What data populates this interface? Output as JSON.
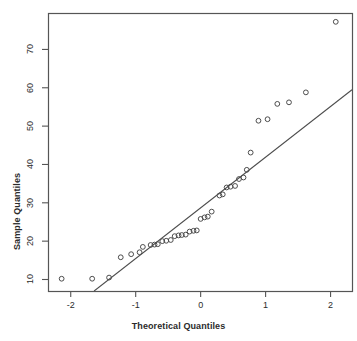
{
  "chart_data": {
    "type": "scatter",
    "title": "",
    "xlabel": "Theoretical Quantiles",
    "ylabel": "Sample Quantiles",
    "xlim": [
      -2.35,
      2.33
    ],
    "ylim": [
      7.0,
      79.5
    ],
    "xticks": [
      -2,
      -1,
      0,
      1,
      2
    ],
    "xtick_labels": [
      "-2",
      "-1",
      "0",
      "1",
      "2"
    ],
    "yticks": [
      10,
      20,
      30,
      40,
      50,
      60,
      70
    ],
    "ytick_labels": [
      "10",
      "20",
      "30",
      "40",
      "50",
      "60",
      "70"
    ],
    "grid": false,
    "legend": null,
    "frame": true,
    "marker": "open-circle",
    "marker_color": "#4d4d4d",
    "line_color": "#4d4d4d",
    "points": [
      {
        "x": -2.14,
        "y": 10.2
      },
      {
        "x": -1.67,
        "y": 10.2
      },
      {
        "x": -1.41,
        "y": 10.5
      },
      {
        "x": -1.23,
        "y": 15.8
      },
      {
        "x": -1.07,
        "y": 16.6
      },
      {
        "x": -0.94,
        "y": 17.1
      },
      {
        "x": -0.89,
        "y": 18.5
      },
      {
        "x": -0.77,
        "y": 19.0
      },
      {
        "x": -0.71,
        "y": 19.1
      },
      {
        "x": -0.66,
        "y": 19.2
      },
      {
        "x": -0.59,
        "y": 20.0
      },
      {
        "x": -0.53,
        "y": 20.1
      },
      {
        "x": -0.46,
        "y": 20.3
      },
      {
        "x": -0.4,
        "y": 21.3
      },
      {
        "x": -0.34,
        "y": 21.5
      },
      {
        "x": -0.29,
        "y": 21.6
      },
      {
        "x": -0.23,
        "y": 21.7
      },
      {
        "x": -0.17,
        "y": 22.5
      },
      {
        "x": -0.11,
        "y": 22.7
      },
      {
        "x": -0.06,
        "y": 22.8
      },
      {
        "x": 0.0,
        "y": 25.8
      },
      {
        "x": 0.06,
        "y": 26.2
      },
      {
        "x": 0.11,
        "y": 26.4
      },
      {
        "x": 0.17,
        "y": 27.7
      },
      {
        "x": 0.29,
        "y": 31.9
      },
      {
        "x": 0.34,
        "y": 32.2
      },
      {
        "x": 0.4,
        "y": 34.0
      },
      {
        "x": 0.46,
        "y": 34.2
      },
      {
        "x": 0.53,
        "y": 34.4
      },
      {
        "x": 0.59,
        "y": 36.2
      },
      {
        "x": 0.66,
        "y": 36.6
      },
      {
        "x": 0.71,
        "y": 38.6
      },
      {
        "x": 0.77,
        "y": 43.1
      },
      {
        "x": 0.89,
        "y": 51.4
      },
      {
        "x": 1.03,
        "y": 51.8
      },
      {
        "x": 1.18,
        "y": 55.8
      },
      {
        "x": 1.36,
        "y": 56.2
      },
      {
        "x": 1.62,
        "y": 58.8
      },
      {
        "x": 2.08,
        "y": 77.2
      }
    ],
    "reference_line": {
      "x0": -1.64,
      "y0": 7.0,
      "x1": 2.33,
      "y1": 59.5
    }
  }
}
